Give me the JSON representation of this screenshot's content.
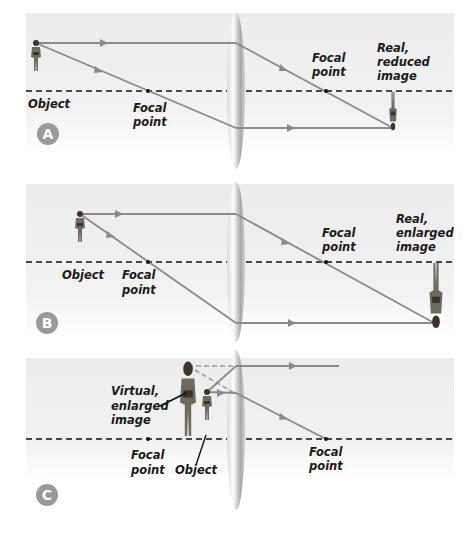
{
  "panels": [
    {
      "id": "A",
      "badge": "A",
      "object_label": "Object",
      "focal_left_label": [
        "Focal",
        "point"
      ],
      "focal_right_label": [
        "Focal",
        "point"
      ],
      "image_label": [
        "Real,",
        "reduced",
        "image"
      ]
    },
    {
      "id": "B",
      "badge": "B",
      "object_label": "Object",
      "focal_left_label": [
        "Focal",
        "point"
      ],
      "focal_right_label": [
        "Focal",
        "point"
      ],
      "image_label": [
        "Real,",
        "enlarged",
        "image"
      ]
    },
    {
      "id": "C",
      "badge": "C",
      "object_label": "Object",
      "focal_left_label": [
        "Focal",
        "point"
      ],
      "focal_right_label": [
        "Focal",
        "point"
      ],
      "image_label": [
        "Virtual,",
        "enlarged",
        "image"
      ]
    }
  ],
  "colors": {
    "panel_bg": "#eeeeee",
    "ray": "#8a8a8a",
    "axis": "#111111",
    "lens": "#bdbdbd",
    "badge": "#9a9a9a",
    "figure": "#6e6a62"
  }
}
